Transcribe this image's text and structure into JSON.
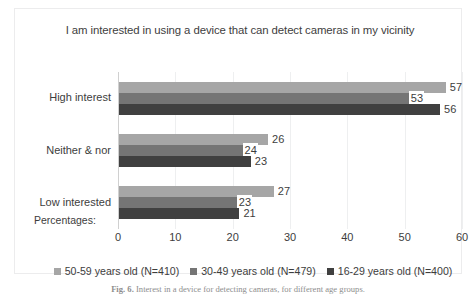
{
  "chart_data": {
    "type": "bar",
    "orientation": "horizontal",
    "title": "I am interested in using a device that can detect cameras in my vicinity",
    "xlabel": "",
    "ylabel": "",
    "axis_note": "Percentages:",
    "categories": [
      "High interest",
      "Neither & nor",
      "Low interested"
    ],
    "series": [
      {
        "name": "50-59 years old (N=410)",
        "color": "#a6a6a6",
        "values": [
          57,
          26,
          27
        ]
      },
      {
        "name": "30-49 years old (N=479)",
        "color": "#757575",
        "values": [
          53,
          24,
          23
        ]
      },
      {
        "name": "16-29 years old (N=400)",
        "color": "#404040",
        "values": [
          56,
          23,
          21
        ]
      }
    ],
    "xlim": [
      0,
      60
    ],
    "xticks": [
      0,
      10,
      20,
      30,
      40,
      50,
      60
    ],
    "grid": true,
    "legend_position": "bottom",
    "data_labels": true
  },
  "figure": {
    "caption_label": "Fig. 6.",
    "caption_text": "Interest in a device for detecting cameras, for different age groups."
  },
  "colors": {
    "series_light": "#a6a6a6",
    "series_medium": "#757575",
    "series_dark": "#404040",
    "gridline": "#eeeff0",
    "frame_border": "#ececed",
    "text": "#3d3d3d"
  }
}
